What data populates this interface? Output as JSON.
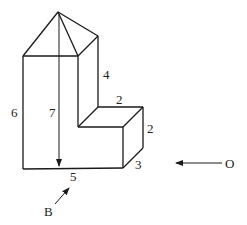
{
  "diagram": {
    "type": "3d-solid-views",
    "labels": {
      "dim_left_height": "6",
      "dim_total_height": "7",
      "dim_upper_right": "4",
      "dim_step_top": "2",
      "dim_step_height": "2",
      "dim_depth": "3",
      "dim_front_width": "5",
      "view_b": "B",
      "view_o": "O"
    }
  }
}
